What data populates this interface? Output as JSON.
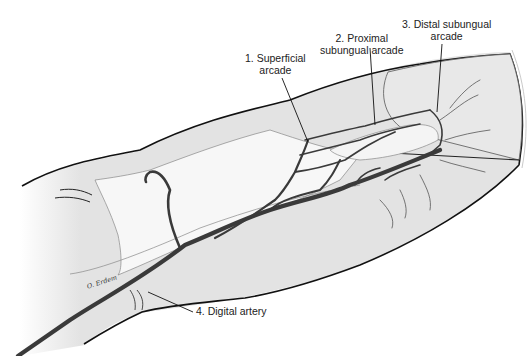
{
  "figure": {
    "labels": [
      {
        "id": "1",
        "line1": "1. Superficial",
        "line2": "arcade"
      },
      {
        "id": "2",
        "line1": "2. Proximal",
        "line2": "subungual arcade"
      },
      {
        "id": "3",
        "line1": "3. Distal subungual",
        "line2": "arcade"
      },
      {
        "id": "4",
        "line1": "4. Digital artery",
        "line2": ""
      }
    ],
    "signature": "O. Erdem",
    "colors": {
      "skin": "#e3e3e3",
      "bone": "#f7f7f7",
      "vessel": "#3a3a3a",
      "outline": "#111111"
    }
  }
}
